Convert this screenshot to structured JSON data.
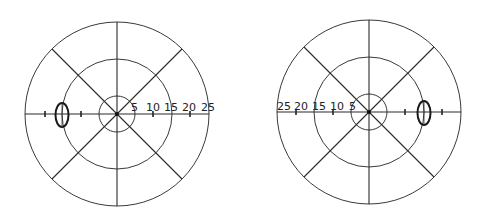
{
  "figure": {
    "type": "visual-field-perimetry-charts",
    "scale_labels_degrees": [
      "5",
      "10",
      "15",
      "20",
      "25"
    ],
    "ring_degrees": [
      5,
      15,
      25
    ],
    "meridians": 8
  },
  "left_chart": {
    "name": "left-eye-field",
    "labels": [
      "5",
      "10",
      "15",
      "20",
      "25"
    ],
    "label_side": "right",
    "blind_spot": {
      "side": "left",
      "eccentricity_deg": 15,
      "width_deg": 3.5,
      "height_deg": 6.5
    }
  },
  "right_chart": {
    "name": "right-eye-field",
    "labels": [
      "25",
      "20",
      "15",
      "10",
      "5"
    ],
    "label_side": "left",
    "blind_spot": {
      "side": "right",
      "eccentricity_deg": 15,
      "width_deg": 3.5,
      "height_deg": 6.5
    }
  }
}
